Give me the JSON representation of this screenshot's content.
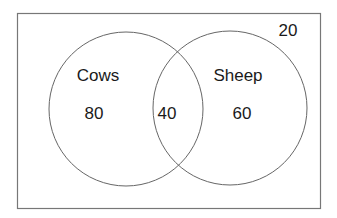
{
  "diagram": {
    "type": "venn",
    "sets": [
      {
        "label": "Cows",
        "only_value": "80"
      },
      {
        "label": "Sheep",
        "only_value": "60"
      }
    ],
    "intersection_value": "40",
    "outside_value": "20"
  },
  "labels": {
    "cows": "Cows",
    "sheep": "Sheep",
    "cows_only": "80",
    "both": "40",
    "sheep_only": "60",
    "neither": "20"
  }
}
